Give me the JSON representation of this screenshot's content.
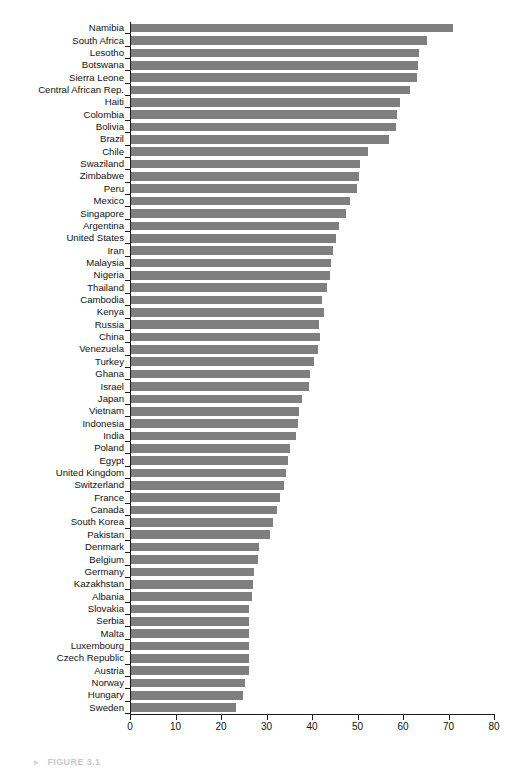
{
  "figure": {
    "caption_bullet": "▸",
    "caption_text": "FIGURE 3.1"
  },
  "chart_data": {
    "type": "bar",
    "orientation": "horizontal",
    "title": "",
    "subtitle": "",
    "xlabel": "",
    "ylabel": "",
    "xlim": [
      0,
      80
    ],
    "ylim": null,
    "grid": false,
    "legend": null,
    "bar_color": "#7f7f7f",
    "axis_color": "#1a1a1a",
    "background": "#ffffff",
    "xticks": [
      0,
      10,
      20,
      30,
      40,
      50,
      60,
      70,
      80
    ],
    "xtick_labels": [
      "0",
      "10",
      "20",
      "30",
      "40",
      "50",
      "60",
      "70",
      "80"
    ],
    "categories": [
      "Namibia",
      "South Africa",
      "Lesotho",
      "Botswana",
      "Sierra Leone",
      "Central African Rep.",
      "Haiti",
      "Colombia",
      "Bolivia",
      "Brazil",
      "Chile",
      "Swaziland",
      "Zimbabwe",
      "Peru",
      "Mexico",
      "Singapore",
      "Argentina",
      "United States",
      "Iran",
      "Malaysia",
      "Nigeria",
      "Thailand",
      "Cambodia",
      "Kenya",
      "Russia",
      "China",
      "Venezuela",
      "Turkey",
      "Ghana",
      "Israel",
      "Japan",
      "Vietnam",
      "Indonesia",
      "India",
      "Poland",
      "Egypt",
      "United Kingdom",
      "Switzerland",
      "France",
      "Canada",
      "South Korea",
      "Pakistan",
      "Denmark",
      "Belgium",
      "Germany",
      "Kazakhstan",
      "Albania",
      "Slovakia",
      "Serbia",
      "Malta",
      "Luxembourg",
      "Czech Republic",
      "Austria",
      "Norway",
      "Hungary",
      "Sweden"
    ],
    "values": [
      70.7,
      65.0,
      63.2,
      63.0,
      62.9,
      61.3,
      59.2,
      58.5,
      58.2,
      56.7,
      52.0,
      50.4,
      50.1,
      49.6,
      48.2,
      47.3,
      45.8,
      45.0,
      44.5,
      44.0,
      43.7,
      43.1,
      41.9,
      42.5,
      41.3,
      41.5,
      41.0,
      40.2,
      39.4,
      39.2,
      37.6,
      37.0,
      36.8,
      36.2,
      34.9,
      34.4,
      34.0,
      33.7,
      32.7,
      32.1,
      31.3,
      30.6,
      28.1,
      28.0,
      27.0,
      26.8,
      26.7,
      26.0,
      26.0,
      26.0,
      26.0,
      26.0,
      26.0,
      25.0,
      24.7,
      23.0
    ]
  }
}
